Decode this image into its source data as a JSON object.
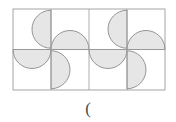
{
  "figure": {
    "caption": "(",
    "caption_color": "#4a4a4a",
    "background_color": "#ffffff",
    "grid": {
      "columns": 4,
      "rows": 2,
      "origin_x": 13,
      "origin_y": 9,
      "cell_width": 38,
      "cell_height": 40.5,
      "line_color": "#9a9a9a",
      "line_width": 0.8,
      "outer_border_color": "#8f8f8f"
    },
    "shape_style": {
      "fill_color": "#e6e6e6",
      "stroke_color": "#8a8a8a",
      "stroke_width": 0.9,
      "shape_type": "half-disc"
    },
    "cells": [
      {
        "row": 0,
        "col": 0,
        "anchor_edge": "right",
        "bulge_direction": "left",
        "name": "half-disc-r0c0"
      },
      {
        "row": 0,
        "col": 1,
        "anchor_edge": "bottom",
        "bulge_direction": "up",
        "name": "half-disc-r0c1"
      },
      {
        "row": 0,
        "col": 2,
        "anchor_edge": "right",
        "bulge_direction": "left",
        "name": "half-disc-r0c2"
      },
      {
        "row": 0,
        "col": 3,
        "anchor_edge": "bottom",
        "bulge_direction": "up",
        "name": "half-disc-r0c3"
      },
      {
        "row": 1,
        "col": 0,
        "anchor_edge": "top",
        "bulge_direction": "down",
        "name": "half-disc-r1c0"
      },
      {
        "row": 1,
        "col": 1,
        "anchor_edge": "left",
        "bulge_direction": "right",
        "name": "half-disc-r1c1"
      },
      {
        "row": 1,
        "col": 2,
        "anchor_edge": "top",
        "bulge_direction": "down",
        "name": "half-disc-r1c2"
      },
      {
        "row": 1,
        "col": 3,
        "anchor_edge": "left",
        "bulge_direction": "right",
        "name": "half-disc-r1c3"
      }
    ]
  }
}
